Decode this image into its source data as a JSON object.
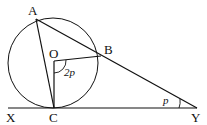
{
  "diagram": {
    "type": "geometry",
    "points": {
      "A": {
        "label": "A",
        "x": 36,
        "y": 19
      },
      "B": {
        "label": "B",
        "x": 101,
        "y": 56
      },
      "O": {
        "label": "O",
        "x": 54,
        "y": 61
      },
      "C": {
        "label": "C",
        "x": 54,
        "y": 108
      },
      "X": {
        "label": "X",
        "x": 10,
        "y": 108
      },
      "Y": {
        "label": "Y",
        "x": 197,
        "y": 108
      }
    },
    "circle": {
      "cx": 53,
      "cy": 63,
      "r": 45
    },
    "angles": {
      "BOC": {
        "label": "2p"
      },
      "AYC": {
        "label": "p"
      }
    },
    "colors": {
      "stroke": "#111111",
      "background": "#ffffff"
    }
  }
}
